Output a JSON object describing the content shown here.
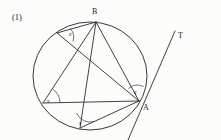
{
  "figure": {
    "number_label": "(1)",
    "background_color": "#fcfcfb",
    "ink_color": "#2c2c2c",
    "circle": {
      "name": "main-circle",
      "center_x": 90,
      "center_y": 76,
      "radius": 55
    },
    "points": [
      {
        "id": "B",
        "label": "B",
        "x": 96,
        "y": 22,
        "label_x": 93,
        "label_y": 14
      },
      {
        "id": "A",
        "label": "A",
        "x": 139,
        "y": 101,
        "label_x": 144,
        "label_y": 110
      },
      {
        "id": "C",
        "label": "",
        "x": 43,
        "y": 103,
        "label_x": 0,
        "label_y": 0
      },
      {
        "id": "D",
        "label": "",
        "x": 80,
        "y": 128,
        "label_x": 0,
        "label_y": 0
      },
      {
        "id": "E",
        "label": "",
        "x": 57,
        "y": 33,
        "label_x": 0,
        "label_y": 0
      },
      {
        "id": "T",
        "label": "T",
        "x": 173,
        "y": 34,
        "label_x": 178,
        "label_y": 38
      }
    ],
    "angle_marks": [
      {
        "id": "angle-at-E",
        "label": "x",
        "label_x": 70,
        "label_y": 35,
        "vertex": "E"
      },
      {
        "id": "angle-at-C",
        "label": "x",
        "label_x": 48,
        "label_y": 102,
        "vertex": "C"
      },
      {
        "id": "angle-at-D",
        "label": "x",
        "label_x": 80,
        "label_y": 124,
        "vertex": "D"
      },
      {
        "id": "angle-at-A-tangent",
        "label": "x",
        "label_x": 135,
        "label_y": 93,
        "vertex": "A"
      }
    ],
    "segments": [
      {
        "id": "chord-BA",
        "from": "B",
        "to": "A"
      },
      {
        "id": "chord-BC",
        "from": "B",
        "to": "C"
      },
      {
        "id": "chord-BD",
        "from": "B",
        "to": "D"
      },
      {
        "id": "chord-BE",
        "from": "B",
        "to": "E"
      },
      {
        "id": "chord-EA",
        "from": "E",
        "to": "A"
      },
      {
        "id": "chord-CA",
        "from": "C",
        "to": "A"
      },
      {
        "id": "chord-DA",
        "from": "D",
        "to": "A"
      },
      {
        "id": "tangent-at-A",
        "from": "tangent-low",
        "to": "T"
      }
    ]
  }
}
